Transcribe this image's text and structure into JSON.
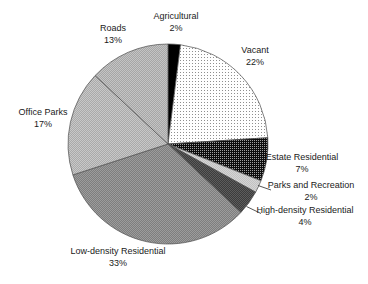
{
  "figure": {
    "width": 368,
    "height": 284,
    "background": "#ffffff",
    "text_color": "#1a1a1a"
  },
  "chart_data": {
    "type": "pie",
    "title": "",
    "unit": "%",
    "start_angle_deg": 0,
    "direction": "clockwise",
    "legend": "none - category and percent labels placed around pie",
    "grid": "off",
    "categories": [
      "Agricultural",
      "Vacant",
      "Estate Residential",
      "Parks and Recreation",
      "High-density Residential",
      "Low-density Residential",
      "Office Parks",
      "Roads"
    ],
    "values": [
      2,
      22,
      7,
      2,
      4,
      33,
      17,
      13
    ],
    "center": {
      "x": 168,
      "y": 144
    },
    "radius": 100,
    "outline_color": "#4d4d4d",
    "leader_color": "#2b2b2b",
    "slices": [
      {
        "label": "Agricultural",
        "value": 2,
        "pct": "2%",
        "fill": {
          "kind": "solid",
          "color": "#000000"
        }
      },
      {
        "label": "Vacant",
        "value": 22,
        "pct": "22%",
        "fill": {
          "kind": "dots",
          "bg": "#ffffff",
          "dot": "#8f8f8f",
          "size": 3
        }
      },
      {
        "label": "Estate Residential",
        "value": 7,
        "pct": "7%",
        "fill": {
          "kind": "dots",
          "bg": "#0d0d0d",
          "dot": "#a0a0a0",
          "size": 2
        }
      },
      {
        "label": "Parks and Recreation",
        "value": 2,
        "pct": "2%",
        "fill": {
          "kind": "checker",
          "c1": "#d4d4d4",
          "c2": "#c2c2c2"
        },
        "leader": [
          258,
          185.5,
          271,
          190
        ]
      },
      {
        "label": "High-density Residential",
        "value": 4,
        "pct": "4%",
        "fill": {
          "kind": "checker",
          "c1": "#3c3c3c",
          "c2": "#5c5c5c"
        },
        "leader": [
          246.5,
          206.5,
          261,
          213.5
        ]
      },
      {
        "label": "Low-density Residential",
        "value": 33,
        "pct": "33%",
        "fill": {
          "kind": "checker",
          "c1": "#7e7e7e",
          "c2": "#9c9c9c"
        }
      },
      {
        "label": "Office Parks",
        "value": 17,
        "pct": "17%",
        "fill": {
          "kind": "checker",
          "c1": "#aaaaaa",
          "c2": "#c8c8c8"
        }
      },
      {
        "label": "Roads",
        "value": 13,
        "pct": "13%",
        "fill": {
          "kind": "checker",
          "c1": "#a6a6a6",
          "c2": "#c4c4c4"
        }
      }
    ]
  }
}
